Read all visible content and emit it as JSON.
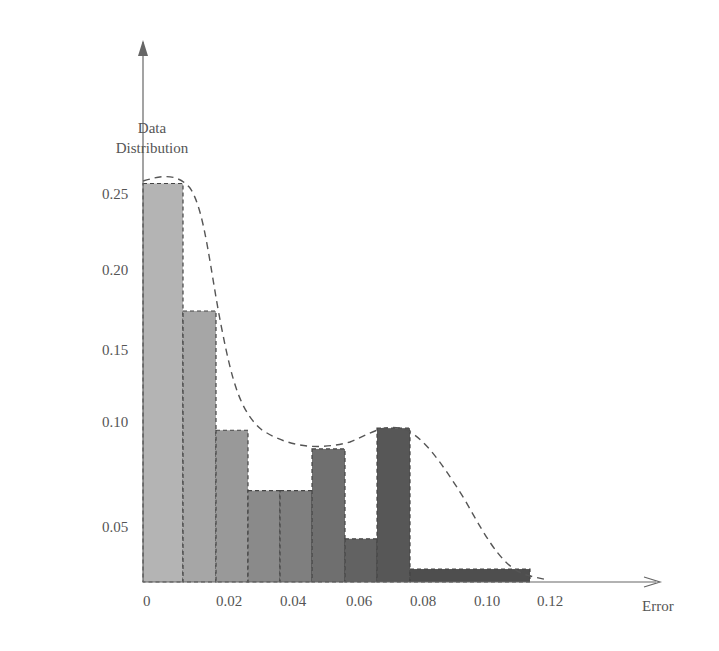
{
  "chart_data": {
    "type": "bar",
    "title": "",
    "xlabel": "Error",
    "ylabel": "Data Distribution",
    "ylabel_lines": [
      "Data",
      "Distribution"
    ],
    "x_ticks": [
      "0",
      "0.02",
      "0.04",
      "0.06",
      "0.08",
      "0.10",
      "0.12"
    ],
    "y_ticks": [
      "0.05",
      "0.10",
      "0.15",
      "0.20",
      "0.25"
    ],
    "bins": [
      {
        "x_start": 0.0,
        "x_end": 0.008,
        "value": 0.255
      },
      {
        "x_start": 0.008,
        "x_end": 0.015,
        "value": 0.175
      },
      {
        "x_start": 0.015,
        "x_end": 0.023,
        "value": 0.097
      },
      {
        "x_start": 0.023,
        "x_end": 0.031,
        "value": 0.068
      },
      {
        "x_start": 0.031,
        "x_end": 0.039,
        "value": 0.068
      },
      {
        "x_start": 0.039,
        "x_end": 0.047,
        "value": 0.088
      },
      {
        "x_start": 0.047,
        "x_end": 0.055,
        "value": 0.04
      },
      {
        "x_start": 0.055,
        "x_end": 0.063,
        "value": 0.098
      },
      {
        "x_start": 0.063,
        "x_end": 0.11,
        "value": 0.012
      }
    ],
    "fitted_curve": "dashed smooth density estimate overlaying the histogram, bimodal with peaks near 0 and 0.065",
    "grid": false,
    "legend": null
  },
  "colors": {
    "bars": [
      "#b4b4b4",
      "#a6a6a6",
      "#999999",
      "#8a8a8a",
      "#7f7f7f",
      "#6f6f6f",
      "#626262",
      "#575757",
      "#4e4e4e"
    ],
    "axis": "#666666",
    "curve": "#555555"
  }
}
